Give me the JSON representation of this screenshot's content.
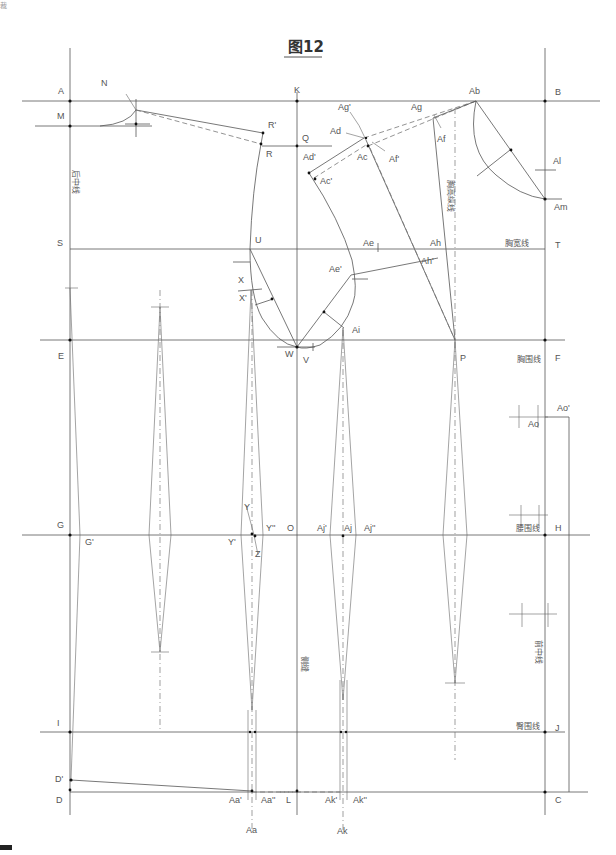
{
  "figure": {
    "title": "图12",
    "corner_text": "裁",
    "points": [
      "A",
      "B",
      "C",
      "D",
      "D'",
      "E",
      "F",
      "G",
      "G'",
      "H",
      "I",
      "J",
      "K",
      "L",
      "M",
      "N",
      "O",
      "P",
      "Q",
      "R",
      "R'",
      "S",
      "T",
      "U",
      "V",
      "W",
      "X",
      "X'",
      "Y",
      "Y'",
      "Y''",
      "Z",
      "Aa",
      "Aa'",
      "Aa''",
      "Ab",
      "Ac",
      "Ac'",
      "Ad",
      "Ad'",
      "Ae",
      "Ae'",
      "Af",
      "Af'",
      "Ag",
      "Ag'",
      "Ah",
      "Ah'",
      "Ai",
      "Aj",
      "Aj'",
      "Aj''",
      "Ak",
      "Ak'",
      "Ak''",
      "Al",
      "Am",
      "Ao",
      "Ao'"
    ],
    "line_labels": {
      "back_center": "后中线",
      "chest_width": "胸宽线",
      "bust_line": "胸围线",
      "waist_line": "腰围线",
      "hip_line": "臀围线",
      "front_center": "前中线",
      "side_seam": "侧缝",
      "bust_vertical": "胸高纵线"
    },
    "labels": {
      "A": "A",
      "B": "B",
      "C": "C",
      "D": "D",
      "Dp": "D'",
      "E": "E",
      "F": "F",
      "G": "G",
      "Gp": "G'",
      "H": "H",
      "I": "I",
      "J": "J",
      "K": "K",
      "L": "L",
      "M": "M",
      "N": "N",
      "O": "O",
      "P": "P",
      "Q": "Q",
      "R": "R",
      "Rp": "R'",
      "S": "S",
      "T": "T",
      "U": "U",
      "V": "V",
      "W": "W",
      "X": "X",
      "Xp": "X'",
      "Y": "Y",
      "Yp": "Y'",
      "Ypp": "Y''",
      "Z": "Z",
      "Aa": "Aa",
      "Aap": "Aa'",
      "Aapp": "Aa''",
      "Ab": "Ab",
      "Ac": "Ac",
      "Acp": "Ac'",
      "Ad": "Ad",
      "Adp": "Ad'",
      "Ae": "Ae",
      "Aep": "Ae'",
      "Af": "Af",
      "Afp": "Af'",
      "Ag": "Ag",
      "Agp": "Ag'",
      "Ah": "Ah",
      "Ahp": "Ah'",
      "Ai": "Ai",
      "Aj": "Aj",
      "Ajp": "Aj'",
      "Ajpp": "Aj''",
      "Ak": "Ak",
      "Akp": "Ak'",
      "Akpp": "Ak''",
      "Al": "Al",
      "Am": "Am",
      "Ao": "Ao",
      "Aop": "Ao'"
    }
  }
}
